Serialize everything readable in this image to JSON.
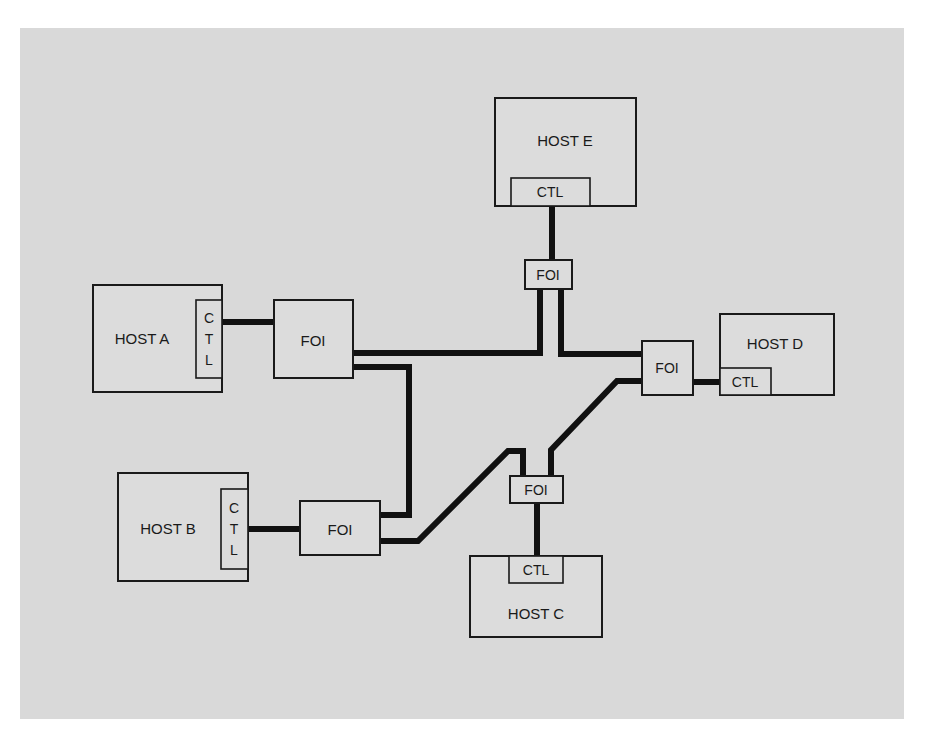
{
  "diagram": {
    "type": "network-topology",
    "background_color": "#d9d9d9",
    "line_color": "#111111",
    "hosts": [
      {
        "id": "A",
        "label": "HOST A",
        "ctl_label": "CTL",
        "ctl_orientation": "vertical",
        "ctl_letters": [
          "C",
          "T",
          "L"
        ]
      },
      {
        "id": "B",
        "label": "HOST B",
        "ctl_label": "CTL",
        "ctl_orientation": "vertical",
        "ctl_letters": [
          "C",
          "T",
          "L"
        ]
      },
      {
        "id": "C",
        "label": "HOST C",
        "ctl_label": "CTL",
        "ctl_orientation": "horizontal"
      },
      {
        "id": "D",
        "label": "HOST D",
        "ctl_label": "CTL",
        "ctl_orientation": "horizontal"
      },
      {
        "id": "E",
        "label": "HOST E",
        "ctl_label": "CTL",
        "ctl_orientation": "horizontal"
      }
    ],
    "interfaces": [
      {
        "id": "FOI-A",
        "label": "FOI",
        "attached_to": "HOST A"
      },
      {
        "id": "FOI-B",
        "label": "FOI",
        "attached_to": "HOST B"
      },
      {
        "id": "FOI-C",
        "label": "FOI",
        "attached_to": "HOST C"
      },
      {
        "id": "FOI-D",
        "label": "FOI",
        "attached_to": "HOST D"
      },
      {
        "id": "FOI-E",
        "label": "FOI",
        "attached_to": "HOST E"
      }
    ],
    "connections": [
      {
        "from": "HOST A CTL",
        "to": "FOI-A"
      },
      {
        "from": "HOST B CTL",
        "to": "FOI-B"
      },
      {
        "from": "HOST C CTL",
        "to": "FOI-C"
      },
      {
        "from": "HOST D CTL",
        "to": "FOI-D"
      },
      {
        "from": "HOST E CTL",
        "to": "FOI-E"
      },
      {
        "from": "FOI-A",
        "to": "FOI-E"
      },
      {
        "from": "FOI-E",
        "to": "FOI-D"
      },
      {
        "from": "FOI-A",
        "to": "FOI-B"
      },
      {
        "from": "FOI-B",
        "to": "FOI-C"
      },
      {
        "from": "FOI-C",
        "to": "FOI-D"
      }
    ]
  }
}
